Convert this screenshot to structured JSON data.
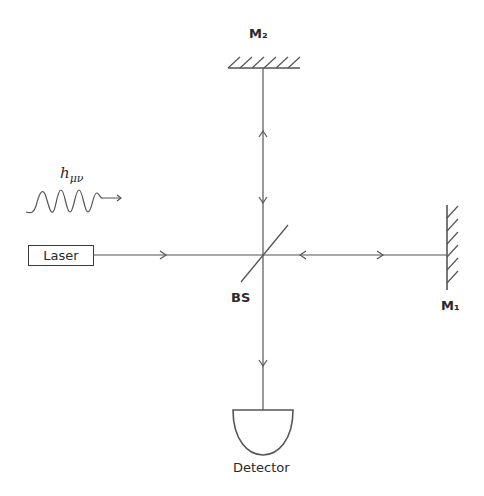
{
  "diagram": {
    "type": "Michelson interferometer",
    "labels": {
      "mirror2": "M₂",
      "mirror1": "M₁",
      "beam_splitter": "BS",
      "laser": "Laser",
      "detector": "Detector",
      "wave": "h",
      "wave_sub": "μν"
    },
    "colors": {
      "line": "#555555",
      "text": "#2a2a2a",
      "background": "#ffffff"
    }
  }
}
